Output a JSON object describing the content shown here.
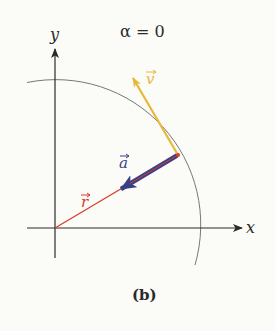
{
  "title": "α = 0",
  "caption": "(b)",
  "axes": {
    "x_label": "x",
    "y_label": "y"
  },
  "vectors": {
    "r": {
      "label": "r",
      "color": "#d83a26"
    },
    "v": {
      "label": "v",
      "color": "#e8b83a"
    },
    "a": {
      "label": "a",
      "color": "#3a3f86"
    }
  },
  "colors": {
    "axis": "#2a2a2a",
    "arc": "#777777",
    "background": "#fbfbf8"
  }
}
